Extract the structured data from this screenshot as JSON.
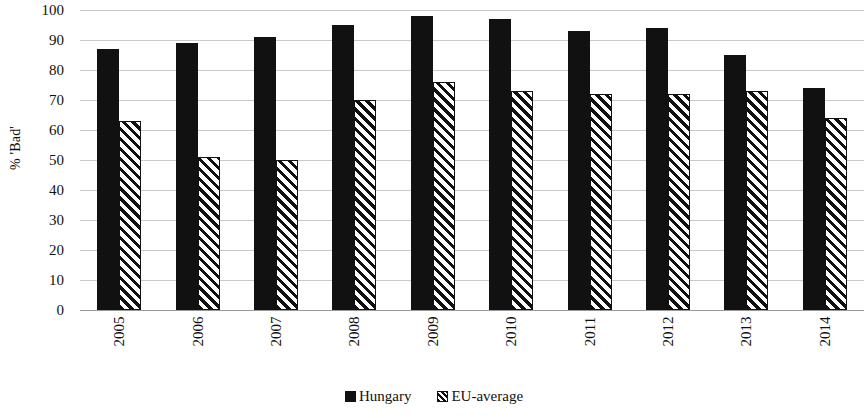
{
  "chart_data": {
    "type": "bar",
    "title": "",
    "subtitle": "",
    "xlabel": "",
    "ylabel": "% 'Bad'",
    "categories": [
      "2005",
      "2006",
      "2007",
      "2008",
      "2009",
      "2010",
      "2011",
      "2012",
      "2013",
      "2014"
    ],
    "series": [
      {
        "name": "Hungary",
        "fill": "solid-black",
        "color": "#111111",
        "values": [
          87,
          89,
          91,
          95,
          98,
          97,
          93,
          94,
          85,
          74
        ]
      },
      {
        "name": "EU-average",
        "fill": "diagonal-hatch",
        "color": "#111111",
        "values": [
          63,
          51,
          50,
          70,
          76,
          73,
          72,
          72,
          73,
          64
        ]
      }
    ],
    "ylim": [
      0,
      100
    ],
    "yticks": [
      0,
      10,
      20,
      30,
      40,
      50,
      60,
      70,
      80,
      90,
      100
    ],
    "ytick_labels": [
      "0",
      "10",
      "20",
      "30",
      "40",
      "50",
      "60",
      "70",
      "80",
      "90",
      "100"
    ],
    "grid": true,
    "grid_axis": "y",
    "legend_position": "bottom-center",
    "legend_entries": [
      "Hungary",
      "EU-average"
    ]
  },
  "axis": {
    "y_title": "% 'Bad'"
  },
  "legend": {
    "entries": [
      {
        "label": "Hungary"
      },
      {
        "label": "EU-average"
      }
    ]
  }
}
